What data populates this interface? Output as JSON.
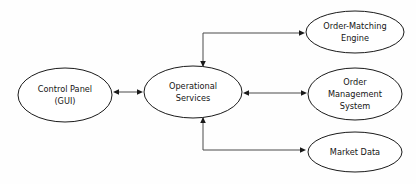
{
  "diagram": {
    "background_color": "#fefefe",
    "node_fill": "#ffffff",
    "node_stroke": "#1a1a1a",
    "edge_color": "#4a4a4a",
    "text_color": "#151515",
    "nodes": [
      {
        "id": "control-panel",
        "lines": [
          "Control Panel",
          "(GUI)"
        ],
        "line1": "Control Panel",
        "line2": "(GUI)",
        "cx": 65,
        "cy": 95,
        "rx": 47,
        "ry": 27
      },
      {
        "id": "operational-services",
        "lines": [
          "Operational",
          "Services"
        ],
        "line1": "Operational",
        "line2": "Services",
        "cx": 193,
        "cy": 92,
        "rx": 49,
        "ry": 26
      },
      {
        "id": "order-matching-engine",
        "lines": [
          "Order-Matching",
          "Engine"
        ],
        "line1": "Order-Matching",
        "line2": "Engine",
        "cx": 355,
        "cy": 32,
        "rx": 49,
        "ry": 21
      },
      {
        "id": "order-management-system",
        "lines": [
          "Order",
          "Management",
          "System"
        ],
        "line1": "Order",
        "line2": "Management",
        "line3": "System",
        "cx": 355,
        "cy": 94,
        "rx": 47,
        "ry": 26
      },
      {
        "id": "market-data",
        "lines": [
          "Market Data"
        ],
        "line1": "Market Data",
        "cx": 355,
        "cy": 152,
        "rx": 47,
        "ry": 20
      }
    ],
    "edges": [
      {
        "id": "control-panel-to-operational-services",
        "from": "control-panel",
        "to": "operational-services",
        "direction": "bidirectional",
        "path": "M 113 92 L 143 92"
      },
      {
        "id": "operational-services-to-order-matching-engine",
        "from": "operational-services",
        "to": "order-matching-engine",
        "direction": "bidirectional",
        "path": "M 203 67 L 203 33 L 305 33"
      },
      {
        "id": "operational-services-to-order-management-system",
        "from": "operational-services",
        "to": "order-management-system",
        "direction": "bidirectional",
        "path": "M 243 93 L 307 93"
      },
      {
        "id": "operational-services-to-market-data",
        "from": "operational-services",
        "to": "market-data",
        "direction": "bidirectional",
        "path": "M 203 117 L 203 150 L 306 150"
      }
    ]
  }
}
